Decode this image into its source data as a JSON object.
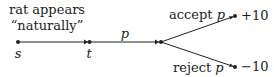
{
  "diagram": {
    "annotation_line1": "rat appears",
    "annotation_line2": "“naturally”",
    "nodes": {
      "s": "s",
      "t": "t"
    },
    "edge_label_main": "p",
    "branches": [
      {
        "label_text": "accept ",
        "label_var": "p",
        "payoff": "+10"
      },
      {
        "label_text": "reject ",
        "label_var": "p",
        "payoff": "−10"
      }
    ],
    "colors": {
      "stroke": "#222222",
      "background": "#ffffff"
    }
  }
}
